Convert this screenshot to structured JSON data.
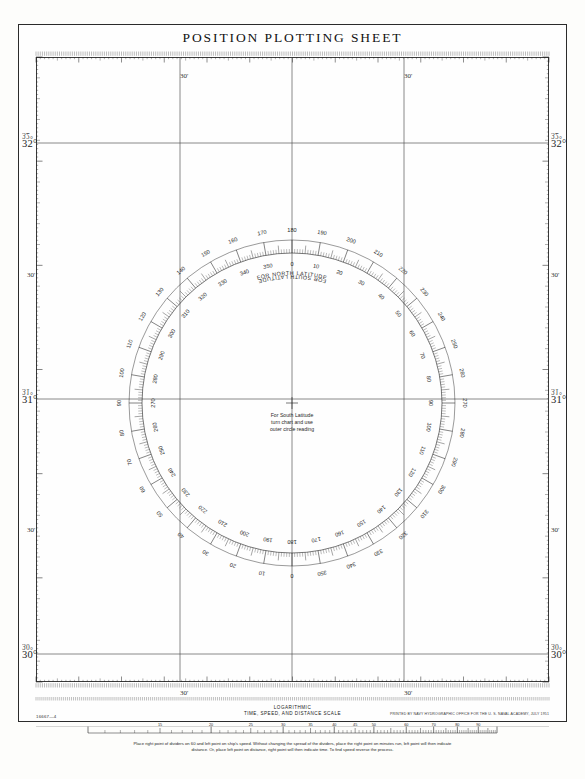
{
  "sheet": {
    "title": "POSITION PLOTTING SHEET",
    "sheet_number": "16667—4",
    "print_credit": "PRINTED BY NAVY HYDROGRAPHIC OFFICE FOR THE U. S. NAVAL ACADEMY, JULY 1951",
    "background_color": "#fdfdfb",
    "ink_color": "#1f1f1f"
  },
  "latitude_scale": {
    "left_labels": [
      {
        "degree": "32°",
        "mirrored": "32°",
        "y": 143
      },
      {
        "degree": "31°",
        "mirrored": "31°",
        "y": 399
      },
      {
        "degree": "30°",
        "mirrored": "30°",
        "y": 654
      }
    ],
    "right_labels": [
      {
        "degree": "32°",
        "mirrored": "32°",
        "y": 143
      },
      {
        "degree": "31°",
        "mirrored": "31°",
        "y": 399
      },
      {
        "degree": "30°",
        "mirrored": "30°",
        "y": 654
      }
    ],
    "minute_labels": [
      {
        "label": "30'",
        "x": 27,
        "y": 271
      },
      {
        "label": "30'",
        "x": 27,
        "y": 526
      },
      {
        "label": "30'",
        "x": 551,
        "y": 271
      },
      {
        "label": "30'",
        "x": 551,
        "y": 526
      }
    ]
  },
  "longitude_scale": {
    "top_labels": [
      {
        "label": "30'",
        "x": 180,
        "y": 72
      },
      {
        "label": "30'",
        "x": 404,
        "y": 72
      }
    ],
    "bottom_labels": [
      {
        "label": "30'",
        "x": 180,
        "y": 689
      },
      {
        "label": "30'",
        "x": 404,
        "y": 689
      }
    ]
  },
  "compass_rose": {
    "center_x": 292,
    "center_y": 403,
    "inner_radius": 150,
    "outer_radius": 178,
    "north_note": "FOR NORTH LATITUDE",
    "south_note": "FOR SOUTH LATITUDE",
    "center_note_lines": [
      "For South Latitude",
      "turn chart and use",
      "outer circle reading"
    ],
    "inner_ring": {
      "direction": "clockwise",
      "zero_at": "top",
      "labels": [
        0,
        10,
        20,
        30,
        40,
        50,
        60,
        70,
        80,
        90,
        100,
        110,
        120,
        130,
        140,
        150,
        160,
        170,
        180,
        190,
        200,
        210,
        220,
        230,
        240,
        250,
        260,
        270,
        280,
        290,
        300,
        310,
        320,
        330,
        340,
        350
      ]
    },
    "outer_ring": {
      "direction": "counter-clockwise",
      "zero_at": "bottom",
      "labels": [
        0,
        10,
        20,
        30,
        40,
        50,
        60,
        70,
        80,
        90,
        100,
        110,
        120,
        130,
        140,
        150,
        160,
        170,
        180,
        190,
        200,
        210,
        220,
        230,
        240,
        250,
        260,
        270,
        280,
        290,
        300,
        310,
        320,
        330,
        340,
        350
      ]
    }
  },
  "log_scale": {
    "caption_line_1": "LOGARITHMIC",
    "caption_line_2": "TIME, SPEED, AND DISTANCE SCALE",
    "tick_labels": [
      "15",
      "20",
      "25",
      "30",
      "35",
      "40",
      "45",
      "50",
      "60",
      "70",
      "80",
      "90"
    ],
    "instructions_line_1": "Place right point of dividers on 60 and left point on ship's speed.   Without changing the spread of the dividers, place the right point on minutes run, left point will then indicate",
    "instructions_line_2": "distance.   Or, place left point on distance, right point will then indicate time.   To find speed reverse the process."
  },
  "grid": {
    "vertical_gridline_x": [
      180,
      292,
      404
    ],
    "horizontal_gridline_y": [
      143,
      399,
      654
    ]
  }
}
